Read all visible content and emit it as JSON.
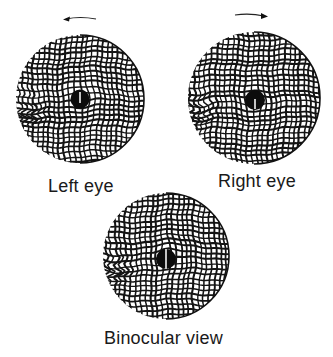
{
  "figure": {
    "panels": [
      {
        "id": "left",
        "caption": "Left eye",
        "rotation_arrow": "counterclockwise",
        "arrow_icon": "curved-arrow-left-icon",
        "marker": "fixation-dot-with-vertical-line"
      },
      {
        "id": "right",
        "caption": "Right eye",
        "rotation_arrow": "clockwise",
        "arrow_icon": "curved-arrow-right-icon",
        "marker": "fixation-dot-with-vertical-line"
      },
      {
        "id": "binocular",
        "caption": "Binocular view",
        "rotation_arrow": "none",
        "marker": "fixation-dot-with-vertical-line"
      }
    ],
    "colors": {
      "ink": "#141414",
      "background": "#ffffff"
    }
  }
}
